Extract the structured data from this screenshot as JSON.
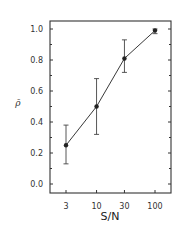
{
  "chart_data": {
    "type": "line",
    "title": "",
    "xlabel": "S/N",
    "ylabel": "ρ̄",
    "x_scale": "log",
    "x": [
      3,
      10,
      30,
      100
    ],
    "categories": [
      "3",
      "10",
      "30",
      "100"
    ],
    "series": [
      {
        "name": "mean rho",
        "values": [
          0.25,
          0.5,
          0.81,
          0.99
        ],
        "error_low": [
          0.13,
          0.32,
          0.72,
          0.97
        ],
        "error_high": [
          0.38,
          0.68,
          0.93,
          1.0
        ],
        "marker": "filled-circle",
        "color": "#222222"
      }
    ],
    "ylim": [
      0.0,
      1.0
    ],
    "y_ticks": [
      "0.0",
      "0.2",
      "0.4",
      "0.6",
      "0.8",
      "1.0"
    ],
    "x_ticks": [
      "3",
      "10",
      "30",
      "100"
    ],
    "grid": false,
    "legend": null
  }
}
